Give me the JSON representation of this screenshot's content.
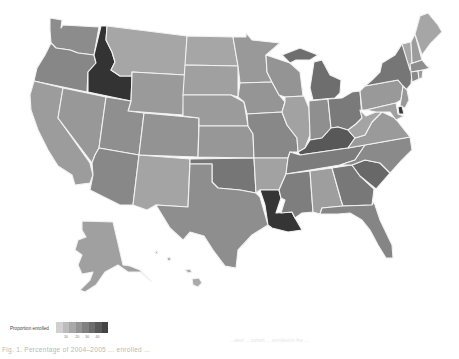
{
  "figure": {
    "caption": "Fig. 1. Percentage of 2004–2005 ... enrolled ...",
    "caption_faded": "...ated ... cohort ... enrolled in the ... ",
    "shade_scale": {
      "low": "#cdcdcd",
      "high": "#303030"
    }
  },
  "legend": {
    "title": "Proportion enrolled",
    "ticks": [
      "10",
      "20",
      "30",
      "40"
    ],
    "gradient": [
      "#d0d0d0",
      "#bcbcbc",
      "#a8a8a8",
      "#949494",
      "#808080",
      "#6c6c6c",
      "#585858",
      "#444444"
    ]
  },
  "states": [
    {
      "code": "WA",
      "fill": "#8c8c8c"
    },
    {
      "code": "OR",
      "fill": "#878787"
    },
    {
      "code": "CA",
      "fill": "#9c9c9c"
    },
    {
      "code": "ID",
      "fill": "#333333"
    },
    {
      "code": "NV",
      "fill": "#989898"
    },
    {
      "code": "MT",
      "fill": "#a6a6a6"
    },
    {
      "code": "WY",
      "fill": "#9a9a9a"
    },
    {
      "code": "UT",
      "fill": "#8f8f8f"
    },
    {
      "code": "AZ",
      "fill": "#888888"
    },
    {
      "code": "CO",
      "fill": "#939393"
    },
    {
      "code": "NM",
      "fill": "#a4a4a4"
    },
    {
      "code": "ND",
      "fill": "#a6a6a6"
    },
    {
      "code": "SD",
      "fill": "#a0a0a0"
    },
    {
      "code": "NE",
      "fill": "#9b9b9b"
    },
    {
      "code": "KS",
      "fill": "#979797"
    },
    {
      "code": "OK",
      "fill": "#767676"
    },
    {
      "code": "TX",
      "fill": "#8e8e8e"
    },
    {
      "code": "MN",
      "fill": "#999999"
    },
    {
      "code": "IA",
      "fill": "#959595"
    },
    {
      "code": "MO",
      "fill": "#888888"
    },
    {
      "code": "AR",
      "fill": "#a2a2a2"
    },
    {
      "code": "LA",
      "fill": "#353535"
    },
    {
      "code": "WI",
      "fill": "#949494"
    },
    {
      "code": "IL",
      "fill": "#a2a2a2"
    },
    {
      "code": "MI",
      "fill": "#6e6e6e"
    },
    {
      "code": "IN",
      "fill": "#8f8f8f"
    },
    {
      "code": "OH",
      "fill": "#7a7a7a"
    },
    {
      "code": "KY",
      "fill": "#585858"
    },
    {
      "code": "TN",
      "fill": "#7c7c7c"
    },
    {
      "code": "MS",
      "fill": "#7e7e7e"
    },
    {
      "code": "AL",
      "fill": "#9e9e9e"
    },
    {
      "code": "GA",
      "fill": "#787878"
    },
    {
      "code": "FL",
      "fill": "#858585"
    },
    {
      "code": "SC",
      "fill": "#686868"
    },
    {
      "code": "NC",
      "fill": "#8a8a8a"
    },
    {
      "code": "VA",
      "fill": "#9a9a9a"
    },
    {
      "code": "WV",
      "fill": "#a4a4a4"
    },
    {
      "code": "PA",
      "fill": "#999999"
    },
    {
      "code": "NY",
      "fill": "#767676"
    },
    {
      "code": "NJ",
      "fill": "#999999"
    },
    {
      "code": "DE",
      "fill": "#3a3a3a"
    },
    {
      "code": "MD",
      "fill": "#a0a0a0"
    },
    {
      "code": "VT",
      "fill": "#a8a8a8"
    },
    {
      "code": "NH",
      "fill": "#9c9c9c"
    },
    {
      "code": "ME",
      "fill": "#a6a6a6"
    },
    {
      "code": "MA",
      "fill": "#8e8e8e"
    },
    {
      "code": "CT",
      "fill": "#8a8a8a"
    },
    {
      "code": "RI",
      "fill": "#9a9a9a"
    },
    {
      "code": "AK",
      "fill": "#a0a0a0"
    },
    {
      "code": "HI",
      "fill": "#aaaaaa"
    }
  ]
}
